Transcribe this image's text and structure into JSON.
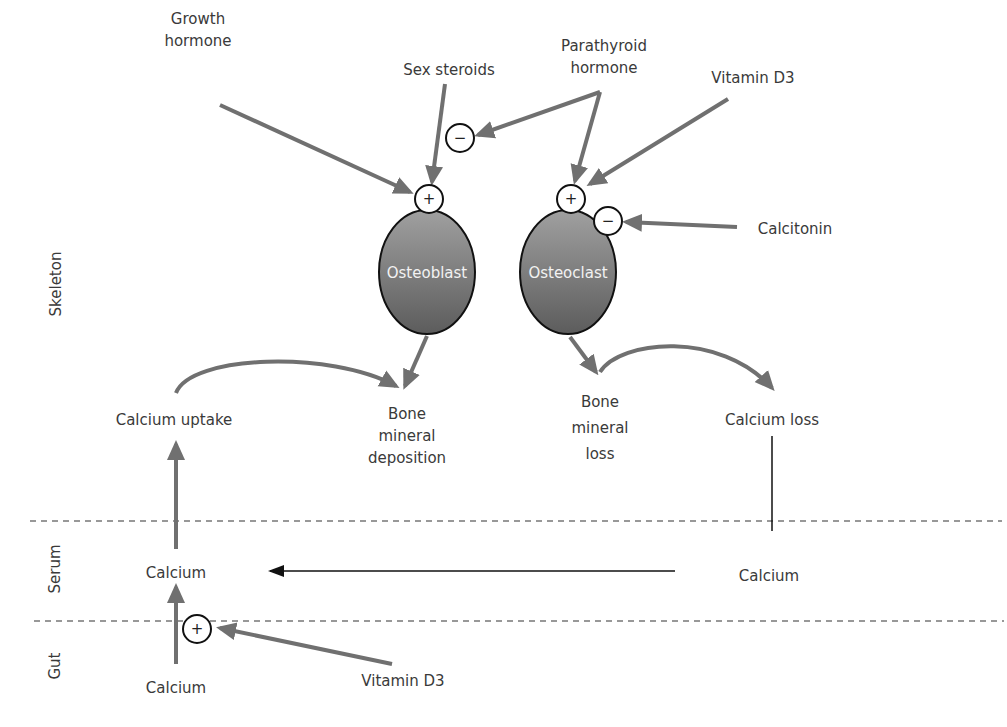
{
  "diagram": {
    "regions": [
      {
        "id": "skeleton",
        "label": "Skeleton"
      },
      {
        "id": "serum",
        "label": "Serum"
      },
      {
        "id": "gut",
        "label": "Gut"
      }
    ],
    "regulators": {
      "growth_hormone": "Growth\nhormone",
      "sex_steroids": "Sex steroids",
      "parathyroid_hormone": "Parathyroid\nhormone",
      "vitamin_d3_top": "Vitamin D3",
      "calcitonin": "Calcitonin",
      "vitamin_d3_gut": "Vitamin D3"
    },
    "cells": {
      "osteoblast": "Osteoblast",
      "osteoclast": "Osteoclast"
    },
    "processes": {
      "calcium_uptake": "Calcium uptake",
      "bone_mineral_deposition": "Bone\nmineral\ndeposition",
      "bone_mineral_loss": "Bone\nmineral\nloss",
      "calcium_loss": "Calcium loss",
      "serum_calcium_left": "Calcium",
      "serum_calcium_right": "Calcium",
      "gut_calcium": "Calcium"
    },
    "signs": {
      "plus": "+",
      "minus": "−"
    },
    "colors": {
      "arrow_gray": "#707070",
      "cell_fill_top": "#9a9a9a",
      "cell_fill_bottom": "#5e5e5e",
      "text": "#3a3a3a",
      "black": "#111111"
    }
  }
}
